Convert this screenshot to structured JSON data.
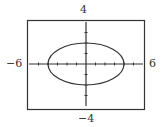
{
  "chart_data": {
    "type": "line",
    "title": "",
    "xlabel": "",
    "ylabel": "",
    "xlim": [
      -6,
      6
    ],
    "ylim": [
      -4,
      4
    ],
    "grid": false,
    "legend": null,
    "tick_labels": {
      "x_min": "−6",
      "x_max": "6",
      "y_min": "−4",
      "y_max": "4"
    },
    "x_ticks": [
      -5,
      -4,
      -3,
      -2,
      -1,
      1,
      2,
      3,
      4,
      5
    ],
    "y_ticks": [
      -3,
      -2,
      -1,
      1,
      2,
      3
    ],
    "series": [
      {
        "name": "ellipse",
        "equation": "x^2/16 + y^2/4 = 1",
        "center": [
          0,
          0
        ],
        "semi_major_x": 4,
        "semi_minor_y": 2
      }
    ]
  },
  "colors": {
    "stroke": "#333333",
    "background": "#ffffff"
  }
}
